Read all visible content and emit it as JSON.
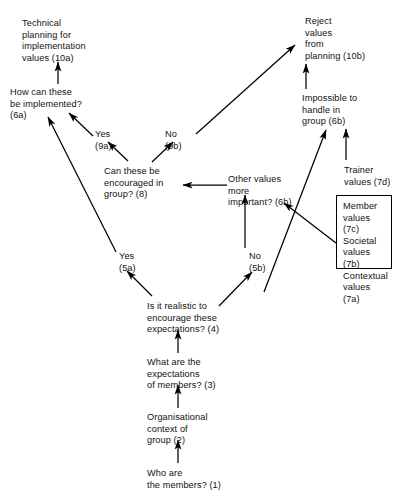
{
  "diagram": {
    "background_color": "#ffffff",
    "line_color": "#000000",
    "text_color": "#111111",
    "nodes": [
      {
        "id": "n10a",
        "label": "Technical\nplanning for\nimplementation\nvalues (10a)",
        "x": 22,
        "y": 18
      },
      {
        "id": "n6a",
        "label": "How can these\nbe implemented?\n(6a)",
        "x": 10,
        "y": 87
      },
      {
        "id": "n9a",
        "label": "Yes\n(9a)",
        "x": 95,
        "y": 129
      },
      {
        "id": "n9b",
        "label": "No\n(9b)",
        "x": 165,
        "y": 129
      },
      {
        "id": "n8",
        "label": "Can these be\nencouraged in\ngroup? (8)",
        "x": 104,
        "y": 166
      },
      {
        "id": "n10b",
        "label": "Reject\nvalues\nfrom\nplanning (10b)",
        "x": 305,
        "y": 16
      },
      {
        "id": "n6b_impossible",
        "label": "Impossible to\nhandle in\ngroup (6b)",
        "x": 302,
        "y": 93
      },
      {
        "id": "n6b_other",
        "label": "Other values\nmore\nimportant? (6b)",
        "x": 228,
        "y": 174
      },
      {
        "id": "n7d",
        "label": "Trainer\nvalues (7d)",
        "x": 344,
        "y": 165
      },
      {
        "id": "n5a",
        "label": "Yes\n(5a)",
        "x": 119,
        "y": 251
      },
      {
        "id": "n5b",
        "label": "No\n(5b)",
        "x": 249,
        "y": 251
      },
      {
        "id": "n4",
        "label": "Is it realistic to\nencourage these\nexpectations? (4)",
        "x": 147,
        "y": 301
      },
      {
        "id": "n3",
        "label": "What are the\nexpectations\nof members? (3)",
        "x": 147,
        "y": 357
      },
      {
        "id": "n2",
        "label": "Organisational\ncontext of\ngroup (2)",
        "x": 147,
        "y": 412
      },
      {
        "id": "n1",
        "label": "Who are\nthe members? (1)",
        "x": 147,
        "y": 468
      }
    ],
    "value_box": {
      "id": "values-box",
      "x": 336,
      "y": 195,
      "width": 56,
      "height": 74,
      "items": [
        {
          "id": "n7c",
          "label": "Member\nvalues (7c)"
        },
        {
          "id": "n7b",
          "label": "Societal\nvalues (7b)"
        },
        {
          "id": "n7a",
          "label": "Contextual\nvalues (7a)"
        }
      ]
    },
    "edges": [
      {
        "id": "e-6a-10a",
        "from": "n6a",
        "to": "n10a",
        "kind": "vertical"
      },
      {
        "id": "e-9a-6a",
        "from": "n9a",
        "to": "n6a",
        "kind": "diagonal"
      },
      {
        "id": "e-5a-6a",
        "from": "n5a",
        "to": "n6a",
        "kind": "diagonal"
      },
      {
        "id": "e-8-9a",
        "from": "n8",
        "to": "n9a",
        "kind": "diagonal"
      },
      {
        "id": "e-8-9b",
        "from": "n8",
        "to": "n9b",
        "kind": "diagonal"
      },
      {
        "id": "e-9b-10b",
        "from": "n9b",
        "to": "n10b",
        "kind": "diagonal"
      },
      {
        "id": "e-6bimp-10b",
        "from": "n6b_impossible",
        "to": "n10b",
        "kind": "vertical"
      },
      {
        "id": "e-7d-6bimp",
        "from": "n7d",
        "to": "n6b_impossible",
        "kind": "vertical"
      },
      {
        "id": "e-5b-6bimp",
        "from": "n5b",
        "to": "n6b_impossible",
        "kind": "diagonal"
      },
      {
        "id": "e-6bother-8",
        "from": "n6b_other",
        "to": "n8",
        "kind": "horizontal"
      },
      {
        "id": "e-5b-6bother",
        "from": "n5b",
        "to": "n6b_other",
        "kind": "vertical"
      },
      {
        "id": "e-box-6bother",
        "from": "values-box",
        "to": "n6b_other",
        "kind": "diagonal"
      },
      {
        "id": "e-4-5a",
        "from": "n4",
        "to": "n5a",
        "kind": "diagonal"
      },
      {
        "id": "e-4-5b",
        "from": "n4",
        "to": "n5b",
        "kind": "diagonal"
      },
      {
        "id": "e-3-4",
        "from": "n3",
        "to": "n4",
        "kind": "vertical"
      },
      {
        "id": "e-2-3",
        "from": "n2",
        "to": "n3",
        "kind": "vertical"
      },
      {
        "id": "e-1-2",
        "from": "n1",
        "to": "n2",
        "kind": "vertical"
      }
    ]
  }
}
